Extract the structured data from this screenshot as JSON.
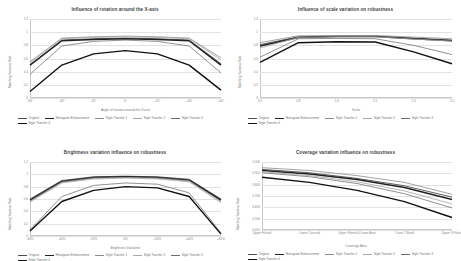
{
  "figure": {
    "background": "#ffffff",
    "panel_count": 4
  },
  "series_names": [
    "Original",
    "Histogram Enhancement",
    "Style Transfer 1",
    "Style Transfer 2",
    "Style Transfer 3",
    "Style Transfer 4"
  ],
  "series_colors": [
    "#4d4d4d",
    "#222222",
    "#8c8c8c",
    "#a6a6a6",
    "#6e6e6e",
    "#111111"
  ],
  "chart_data": [
    {
      "id": "rotation",
      "type": "line",
      "title": "Influence of rotation around the X-axis",
      "xlabel": "Angle of rotation around the X-axis",
      "ylabel": "Matching Success Rate",
      "categories": [
        "-60°",
        "-40°",
        "-20°",
        "0°",
        "+20°",
        "+40°",
        "+60°"
      ],
      "yticks": [
        "1.2",
        "1",
        "0.8",
        "0.6",
        "0.4",
        "0.2",
        "0"
      ],
      "ylim": [
        0,
        1.2
      ],
      "grid": true,
      "legend_position": "bottom",
      "series": [
        {
          "name": "Original",
          "values": [
            0.5,
            0.88,
            0.9,
            0.91,
            0.9,
            0.88,
            0.52
          ]
        },
        {
          "name": "Histogram Enhancement",
          "values": [
            0.5,
            0.87,
            0.89,
            0.9,
            0.89,
            0.87,
            0.5
          ]
        },
        {
          "name": "Style Transfer 1",
          "values": [
            0.55,
            0.91,
            0.93,
            0.94,
            0.93,
            0.91,
            0.61
          ]
        },
        {
          "name": "Style Transfer 2",
          "values": [
            0.53,
            0.9,
            0.92,
            0.93,
            0.92,
            0.9,
            0.58
          ]
        },
        {
          "name": "Style Transfer 3",
          "values": [
            0.36,
            0.79,
            0.86,
            0.88,
            0.86,
            0.79,
            0.38
          ]
        },
        {
          "name": "Style Transfer 4",
          "values": [
            0.1,
            0.5,
            0.67,
            0.72,
            0.67,
            0.5,
            0.12
          ]
        }
      ]
    },
    {
      "id": "scale",
      "type": "line",
      "title": "Influence of scale variation on robustness",
      "xlabel": "Scale",
      "ylabel": "Matching Success Rate",
      "categories": [
        "0.5",
        "0.8",
        "1.0",
        "1.5",
        "2.0",
        "2.5"
      ],
      "yticks": [
        "1.2",
        "1",
        "0.8",
        "0.6",
        "0.4",
        "0.2",
        "0"
      ],
      "ylim": [
        0,
        1.2
      ],
      "grid": true,
      "legend_position": "bottom",
      "series": [
        {
          "name": "Original",
          "values": [
            0.81,
            0.93,
            0.94,
            0.94,
            0.91,
            0.88
          ]
        },
        {
          "name": "Histogram Enhancement",
          "values": [
            0.79,
            0.92,
            0.935,
            0.935,
            0.9,
            0.87
          ]
        },
        {
          "name": "Style Transfer 1",
          "values": [
            0.84,
            0.945,
            0.95,
            0.95,
            0.925,
            0.9
          ]
        },
        {
          "name": "Style Transfer 2",
          "values": [
            0.76,
            0.92,
            0.93,
            0.93,
            0.895,
            0.865
          ]
        },
        {
          "name": "Style Transfer 3",
          "values": [
            0.62,
            0.9,
            0.905,
            0.9,
            0.8,
            0.66
          ]
        },
        {
          "name": "Style Transfer 4",
          "values": [
            0.54,
            0.84,
            0.855,
            0.85,
            0.7,
            0.52
          ]
        }
      ]
    },
    {
      "id": "brightness",
      "type": "line",
      "title": "Brightness variation influence on robustness",
      "xlabel": "Brightness Variations",
      "ylabel": "Matching Success Rate",
      "categories": [
        "-60%",
        "-40%",
        "-20%",
        "0%",
        "+20%",
        "+40%",
        "+60%"
      ],
      "yticks": [
        "1.2",
        "1",
        "0.8",
        "0.6",
        "0.4",
        "0.2",
        "0"
      ],
      "ylim": [
        0,
        1.2
      ],
      "grid": true,
      "legend_position": "bottom",
      "series": [
        {
          "name": "Original",
          "values": [
            0.6,
            0.9,
            0.96,
            0.97,
            0.96,
            0.92,
            0.6
          ]
        },
        {
          "name": "Histogram Enhancement",
          "values": [
            0.58,
            0.885,
            0.95,
            0.96,
            0.95,
            0.905,
            0.58
          ]
        },
        {
          "name": "Style Transfer 1",
          "values": [
            0.57,
            0.875,
            0.94,
            0.95,
            0.94,
            0.895,
            0.56
          ]
        },
        {
          "name": "Style Transfer 2",
          "values": [
            0.55,
            0.86,
            0.925,
            0.94,
            0.925,
            0.88,
            0.54
          ]
        },
        {
          "name": "Style Transfer 3",
          "values": [
            0.1,
            0.64,
            0.82,
            0.86,
            0.84,
            0.7,
            0.05
          ]
        },
        {
          "name": "Style Transfer 4",
          "values": [
            0.08,
            0.56,
            0.74,
            0.8,
            0.78,
            0.64,
            0.03
          ]
        }
      ]
    },
    {
      "id": "coverage",
      "type": "line",
      "title": "Coverage variation influence on robustness",
      "xlabel": "Coverage Area",
      "ylabel": "Matching Success Rate",
      "categories": [
        "Upper Fileted",
        "Lower Covered",
        "Upper Fileted & Lower Area",
        "Cover 2 Band",
        "Upper 3 Fileted"
      ],
      "yticks": [
        "1.000",
        "0.900",
        "0.800",
        "0.700",
        "0.600",
        "0.500",
        "0.400"
      ],
      "ylim": [
        0.4,
        1.0
      ],
      "grid": true,
      "legend_position": "bottom",
      "series": [
        {
          "name": "Original",
          "values": [
            0.935,
            0.905,
            0.855,
            0.79,
            0.69
          ]
        },
        {
          "name": "Histogram Enhancement",
          "values": [
            0.925,
            0.895,
            0.845,
            0.775,
            0.67
          ]
        },
        {
          "name": "Style Transfer 1",
          "values": [
            0.95,
            0.925,
            0.88,
            0.82,
            0.715
          ]
        },
        {
          "name": "Style Transfer 2",
          "values": [
            0.915,
            0.88,
            0.825,
            0.745,
            0.63
          ]
        },
        {
          "name": "Style Transfer 3",
          "values": [
            0.905,
            0.87,
            0.81,
            0.72,
            0.595
          ]
        },
        {
          "name": "Style Transfer 4",
          "values": [
            0.865,
            0.82,
            0.75,
            0.65,
            0.51
          ]
        }
      ]
    }
  ]
}
